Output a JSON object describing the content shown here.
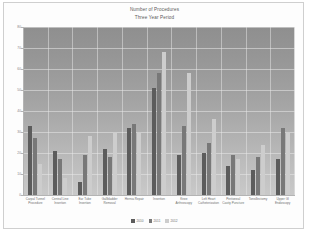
{
  "chart_data": {
    "type": "bar",
    "title": "Number of Procedures",
    "subtitle": "Three Year Period",
    "xlabel": "",
    "ylabel": "",
    "ylim": [
      0,
      80
    ],
    "yticks": [
      0,
      10,
      20,
      30,
      40,
      50,
      60,
      70,
      80
    ],
    "grid": true,
    "legend_position": "bottom",
    "categories": [
      "Carpal Tunnel Procedure",
      "Central Line Insertion",
      "Ear Tube Insertion",
      "Gallbladder Removal",
      "Hernia Repair",
      "Insertion",
      "Knee Arthroscopy",
      "Left Heart Catheterization",
      "Peritoneal Cavity Puncture",
      "Tonsillectomy",
      "Upper GI Endoscopy"
    ],
    "series": [
      {
        "name": "2010",
        "color": "#5c5c5c",
        "values": [
          33,
          21,
          6,
          22,
          32,
          51,
          19,
          20,
          14,
          12,
          17
        ]
      },
      {
        "name": "2011",
        "color": "#787878",
        "values": [
          27,
          17,
          19,
          18,
          34,
          58,
          33,
          25,
          19,
          18,
          32
        ]
      },
      {
        "name": "2012",
        "color": "#cdcdcd",
        "values": [
          15,
          8,
          28,
          30,
          30,
          68,
          58,
          36,
          17,
          24,
          30
        ]
      }
    ]
  },
  "legend": [
    {
      "label": "2010",
      "color": "#5c5c5c"
    },
    {
      "label": "2011",
      "color": "#787878"
    },
    {
      "label": "2012",
      "color": "#cdcdcd"
    }
  ]
}
